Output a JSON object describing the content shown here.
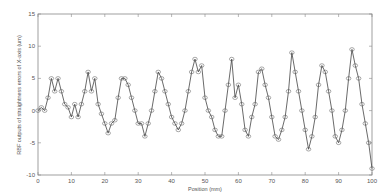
{
  "chart_data": {
    "type": "line",
    "title": "",
    "xlabel": "Position (mm)",
    "ylabel": "RBF outputs of straightness errors of X-axis (um)",
    "xlim": [
      0,
      100
    ],
    "ylim": [
      -10,
      15
    ],
    "x_ticks": [
      0,
      10,
      20,
      30,
      40,
      50,
      60,
      70,
      80,
      90,
      100
    ],
    "y_ticks": [
      -10,
      -5,
      0,
      5,
      10,
      15
    ],
    "grid": false,
    "legend": null,
    "marker": "circle",
    "line_color": "#444444",
    "x": [
      0,
      1,
      2,
      3,
      4,
      5,
      6,
      7,
      8,
      9,
      10,
      11,
      12,
      13,
      14,
      15,
      16,
      17,
      18,
      19,
      20,
      21,
      22,
      23,
      24,
      25,
      26,
      27,
      28,
      29,
      30,
      31,
      32,
      33,
      34,
      35,
      36,
      37,
      38,
      39,
      40,
      41,
      42,
      43,
      44,
      45,
      46,
      47,
      48,
      49,
      50,
      51,
      52,
      53,
      54,
      55,
      56,
      57,
      58,
      59,
      60,
      61,
      62,
      63,
      64,
      65,
      66,
      67,
      68,
      69,
      70,
      71,
      72,
      73,
      74,
      75,
      76,
      77,
      78,
      79,
      80,
      81,
      82,
      83,
      84,
      85,
      86,
      87,
      88,
      89,
      90,
      91,
      92,
      93,
      94,
      95,
      96,
      97,
      98,
      99,
      100
    ],
    "series": [
      {
        "name": "RBF output",
        "values": [
          0,
          0.5,
          0,
          2,
          5,
          3,
          5,
          3,
          1,
          0.5,
          -1,
          1,
          -1,
          1,
          3,
          6,
          3,
          5,
          1,
          -0.5,
          -2,
          -3.5,
          -2,
          -1.5,
          2,
          5,
          5,
          4,
          2,
          0,
          -2,
          -2,
          -4,
          -2,
          0,
          3,
          6,
          5,
          3,
          1,
          -1,
          -2,
          -3,
          -2,
          0,
          3,
          6,
          8,
          6,
          7,
          2,
          0,
          -1,
          -3,
          -4,
          -4,
          0,
          4,
          8,
          2,
          4,
          1,
          -3,
          -4,
          -1,
          1,
          6,
          6.5,
          4,
          2,
          -1,
          -4,
          -4.5,
          -3,
          -1,
          3,
          9,
          6,
          3,
          0,
          -3,
          -6,
          -4,
          -1,
          4,
          7,
          6,
          3,
          0,
          -4,
          -5,
          -3,
          0,
          5,
          9.5,
          7,
          5,
          1,
          -2,
          -5,
          -9
        ]
      }
    ]
  }
}
